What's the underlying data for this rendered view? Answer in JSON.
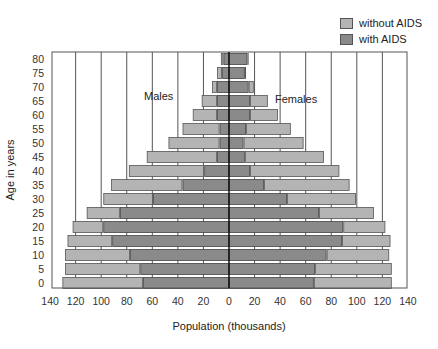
{
  "chart_data": {
    "type": "bar",
    "subtype": "population-pyramid",
    "title": "",
    "xlabel": "Population (thousands)",
    "ylabel": "Age in years",
    "xlim": [
      -140,
      140
    ],
    "x_ticks": [
      140,
      120,
      100,
      80,
      60,
      40,
      20,
      0,
      20,
      40,
      60,
      80,
      100,
      120,
      140
    ],
    "y_ticks": [
      0,
      5,
      10,
      15,
      20,
      25,
      30,
      35,
      40,
      45,
      50,
      55,
      60,
      65,
      70,
      75,
      80
    ],
    "grid": "vertical",
    "legend_position": "top-right",
    "side_labels": {
      "left": "Males",
      "right": "Females"
    },
    "categories": [
      0,
      5,
      10,
      15,
      20,
      25,
      30,
      35,
      40,
      45,
      50,
      55,
      60,
      65,
      70,
      75,
      80
    ],
    "series": [
      {
        "name": "without AIDS",
        "side": "Males",
        "values": [
          130,
          128,
          128,
          126,
          122,
          111,
          98,
          92,
          78,
          64,
          47,
          36,
          28,
          21,
          13,
          9,
          6
        ]
      },
      {
        "name": "with AIDS",
        "side": "Males",
        "values": [
          67,
          69,
          77,
          91,
          98,
          85,
          59,
          36,
          19,
          9,
          7,
          7,
          9,
          9,
          9,
          5,
          4
        ]
      },
      {
        "name": "without AIDS",
        "side": "Females",
        "values": [
          127,
          127,
          125,
          126,
          122,
          113,
          99,
          94,
          86,
          74,
          58,
          48,
          38,
          30,
          19,
          13,
          15
        ]
      },
      {
        "name": "with AIDS",
        "side": "Females",
        "values": [
          66,
          67,
          76,
          88,
          89,
          70,
          45,
          27,
          16,
          12,
          11,
          13,
          16,
          16,
          15,
          12,
          14
        ]
      }
    ],
    "colors": {
      "without AIDS": "#b4b4b4",
      "with AIDS": "#8a8a8a"
    }
  },
  "legend": {
    "items": [
      {
        "label": "without AIDS",
        "color": "#b4b4b4"
      },
      {
        "label": "with AIDS",
        "color": "#8a8a8a"
      }
    ]
  }
}
